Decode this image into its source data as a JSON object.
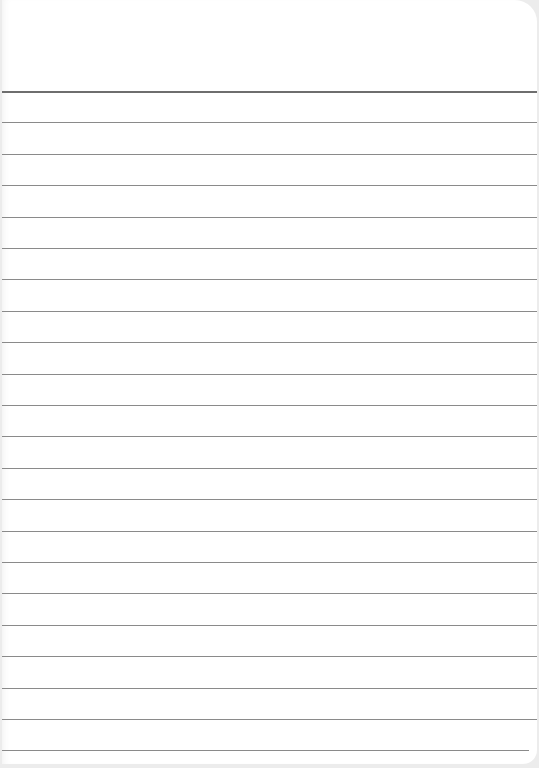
{
  "paper": {
    "type": "lined-paper",
    "background_color": "#ffffff",
    "surround_color": "#ececec",
    "line_color": "#8a8a8a",
    "header_line_color": "#6e6e6e",
    "line_count": 22,
    "first_line_y": 91,
    "line_spacing": 31.4,
    "text": ""
  }
}
